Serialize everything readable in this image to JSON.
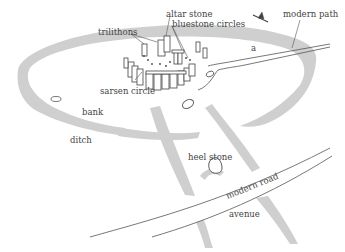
{
  "diagram": {
    "colors": {
      "earthwork": "#cfcfcf",
      "line": "#555555",
      "text": "#444444",
      "background": "#ffffff"
    },
    "labels": {
      "trilithons": "trilithons",
      "altar_stone": "altar stone",
      "bluestone_circles": "bluestone circles",
      "sarsen_circle": "sarsen circle",
      "modern_path": "modern path",
      "bank": "bank",
      "ditch": "ditch",
      "heel_stone": "heel stone",
      "modern_road": "modern road",
      "avenue": "avenue",
      "station_marker": "a"
    },
    "icons": {
      "north_arrow": "bird-like direction marker"
    }
  }
}
